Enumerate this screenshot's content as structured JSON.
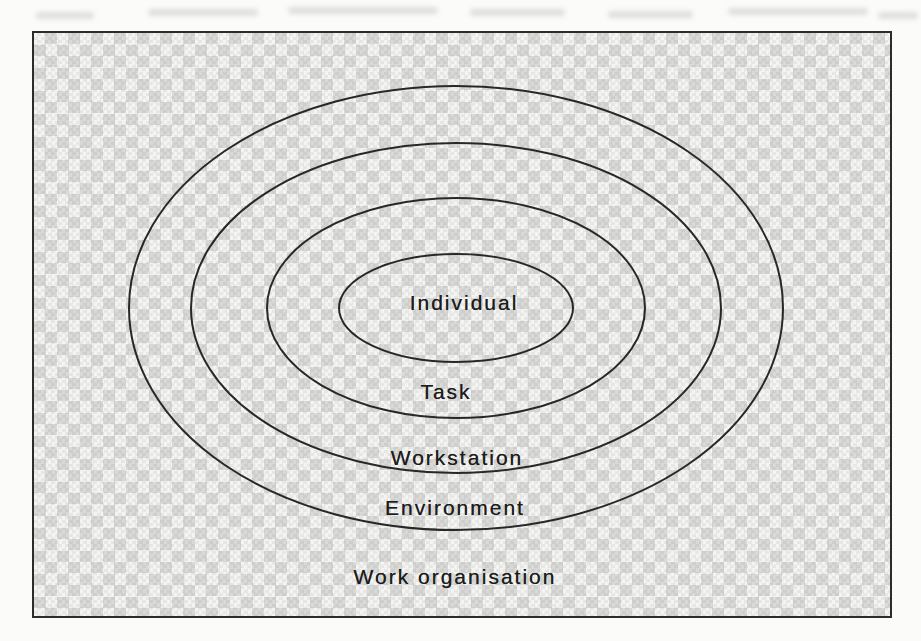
{
  "figure": {
    "type": "concentric-ellipse-diagram",
    "rings": [
      {
        "label": "Individual"
      },
      {
        "label": "Task"
      },
      {
        "label": "Workstation"
      },
      {
        "label": "Environment"
      },
      {
        "label": "Work organisation"
      }
    ],
    "colors": {
      "frame_border": "#2c2c2c",
      "ellipse_stroke": "#282828",
      "label_text": "#1d1d1d",
      "checker_dark": "#d7d7d5",
      "checker_light": "#f3f3f1",
      "page_background": "#fbfbfa"
    }
  }
}
